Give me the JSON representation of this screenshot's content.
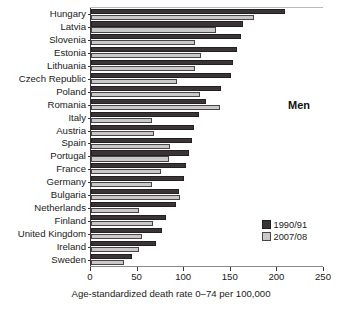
{
  "chart_data": {
    "type": "bar",
    "orientation": "horizontal",
    "title": "",
    "annotation": "Men",
    "xlabel": "Age-standardized death rate 0–74 per 100,000",
    "ylabel": "",
    "xlim": [
      0,
      250
    ],
    "xticks": [
      0,
      50,
      100,
      150,
      200,
      250
    ],
    "xticklabels": [
      "0",
      "50",
      "100",
      "150",
      "200",
      "250"
    ],
    "grid": false,
    "legend_position": "right",
    "categories": [
      "Hungary",
      "Latvia",
      "Slovenia",
      "Estonia",
      "Lithuania",
      "Czech Republic",
      "Poland",
      "Romania",
      "Italy",
      "Austria",
      "Spain",
      "Portugal",
      "France",
      "Germany",
      "Bulgaria",
      "Netherlands",
      "Finland",
      "United Kingdom",
      "Ireland",
      "Sweden"
    ],
    "series": [
      {
        "name": "1990/91",
        "color": "#3a3436",
        "values": [
          208,
          163,
          161,
          157,
          152,
          150,
          139,
          123,
          116,
          110,
          108,
          105,
          102,
          100,
          94,
          91,
          80,
          76,
          70,
          44
        ]
      },
      {
        "name": "2007/08",
        "color": "#c9c9c9",
        "values": [
          175,
          134,
          112,
          118,
          112,
          92,
          117,
          138,
          65,
          68,
          85,
          84,
          75,
          65,
          96,
          51,
          66,
          55,
          52,
          35
        ]
      }
    ]
  },
  "legend": {
    "items": [
      {
        "label": "1990/91",
        "swatch": "dark"
      },
      {
        "label": "2007/08",
        "swatch": "light"
      }
    ]
  }
}
